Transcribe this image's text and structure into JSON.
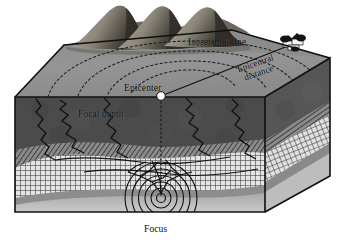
{
  "figure": {
    "background_color": "#ffffff"
  },
  "labels": {
    "isoseismal_line": "Isoseismal line",
    "epicenter": "Epicenter",
    "epicentral_distance_line1": "Epicentral",
    "epicentral_distance_line2": "distance",
    "focal_depth": "Focal depth",
    "focus": "Focus"
  },
  "colors": {
    "outline": "#111111",
    "surface_top": "#8d8d8d",
    "surface_top_light": "#9a9a9a",
    "mountain_light": "#a9a49a",
    "mountain_dark": "#3a3733",
    "layer_dark": "#4a4a4a",
    "layer_hatch": "#6f6f6f",
    "layer_grid_light": "#d8d8d8",
    "layer_mid": "#8a8a8a",
    "layer_bottom": "#b9b9b9",
    "side_face": "#7b7b7b",
    "epicenter_dot": "#ffffff",
    "label_text": "#0a0a0a",
    "town": "#1a1a1a"
  },
  "diagram_elements": {
    "epicenter_marker": "white-filled circle on ground surface",
    "focus_marker": "concentric seismic wave circles at depth",
    "isoseismal_arcs_count": 4,
    "mountain_peaks_count": 3,
    "town_buildings_count": 3,
    "fault_lines": "jagged vertical fractures in upper crust",
    "strata_layers": [
      "dark surface soil",
      "diagonal hatch layer",
      "cross-hatch grid layer",
      "mid gray layer",
      "light bottom layer"
    ]
  }
}
